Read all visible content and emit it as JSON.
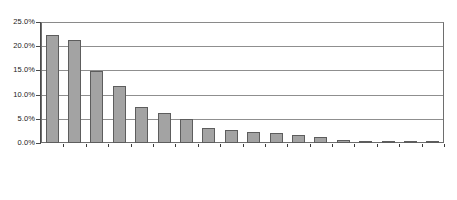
{
  "chart_data": {
    "type": "bar",
    "title": "",
    "subtitle": "",
    "xlabel": "",
    "ylabel": "",
    "ylim": [
      0,
      25
    ],
    "yunit": "%",
    "grid": true,
    "legend": false,
    "legend_position": "none",
    "orientation": "vertical",
    "bar_color": "#a3a3a3",
    "bar_border_color": "#5d5d5d",
    "yticks": [
      0,
      5,
      10,
      15,
      20,
      25
    ],
    "ytick_labels": [
      "0.0%",
      "5.0%",
      "10.0%",
      "15.0%",
      "20.0%",
      "25.0%"
    ],
    "categories": [
      "China",
      "Indonesia",
      "Vietnam",
      "Mexico",
      "Thailand",
      "South Korea",
      "El Salvador",
      "Pakistan",
      "Cambodia",
      "Guatemala",
      "Bangladesh",
      "Malaysia",
      "Taiwan",
      "Honduras",
      "Sri Lanka",
      "India",
      "Brazil",
      "Dominican\nRepublic"
    ],
    "values": [
      22.4,
      21.2,
      14.8,
      11.7,
      7.5,
      6.3,
      5.0,
      3.2,
      2.7,
      2.2,
      2.0,
      1.7,
      1.2,
      0.7,
      0.5,
      0.4,
      0.3,
      0.25
    ]
  }
}
